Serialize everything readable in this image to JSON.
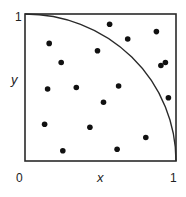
{
  "diagram": {
    "axis_labels": {
      "x": "x",
      "y": "y"
    },
    "ticks": {
      "origin": "0",
      "x_max": "1",
      "y_max": "1"
    },
    "colors": {
      "line": "#2a2a2a",
      "dot": "#111111",
      "background": "#ffffff"
    },
    "points": [
      {
        "x": 0.16,
        "y": 0.8
      },
      {
        "x": 0.24,
        "y": 0.67
      },
      {
        "x": 0.15,
        "y": 0.49
      },
      {
        "x": 0.34,
        "y": 0.5
      },
      {
        "x": 0.56,
        "y": 0.93
      },
      {
        "x": 0.68,
        "y": 0.83
      },
      {
        "x": 0.87,
        "y": 0.88
      },
      {
        "x": 0.48,
        "y": 0.75
      },
      {
        "x": 0.9,
        "y": 0.65
      },
      {
        "x": 0.93,
        "y": 0.67
      },
      {
        "x": 0.62,
        "y": 0.51
      },
      {
        "x": 0.95,
        "y": 0.43
      },
      {
        "x": 0.13,
        "y": 0.25
      },
      {
        "x": 0.25,
        "y": 0.07
      },
      {
        "x": 0.43,
        "y": 0.23
      },
      {
        "x": 0.52,
        "y": 0.4
      },
      {
        "x": 0.8,
        "y": 0.16
      },
      {
        "x": 0.61,
        "y": 0.08
      }
    ]
  }
}
